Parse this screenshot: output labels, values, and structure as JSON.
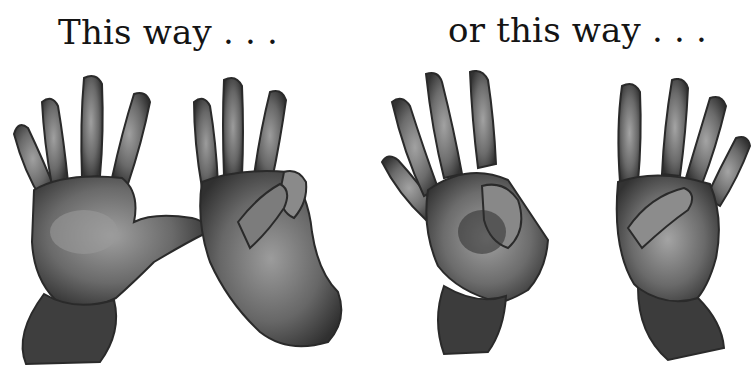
{
  "captions": {
    "left": "This way . . .",
    "right": "or this way . . ."
  },
  "illustrations": [
    {
      "id": "hand-1",
      "description": "open palm, all five fingers spread",
      "group": "left"
    },
    {
      "id": "hand-2",
      "description": "palm with index, middle and ring fingers up; thumb touching folded pinky",
      "group": "left"
    },
    {
      "id": "hand-3",
      "description": "palm with thumb touching bent middle finger, others raised",
      "group": "right"
    },
    {
      "id": "hand-4",
      "description": "palm with thumb touching bent ring finger, others raised",
      "group": "right"
    }
  ],
  "colors": {
    "background": "#ffffff",
    "text": "#141414",
    "skin_dark": "#3a3a3a",
    "skin_mid": "#6e6e6e",
    "skin_light": "#9a9a9a"
  }
}
